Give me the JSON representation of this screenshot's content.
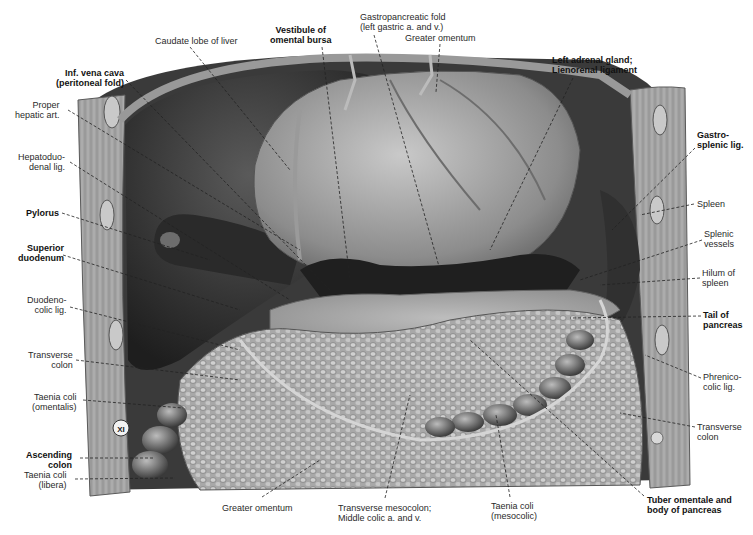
{
  "figure": {
    "vertebra_marker": "XI",
    "colors": {
      "background": "#ffffff",
      "label_text": "#2a2a2a",
      "leader_line": "#222222",
      "tissue_dark": "#2b2b2b",
      "tissue_mid": "#6e6e6e",
      "tissue_light": "#b9b9b9",
      "wall_muscle": "#9a9a9a"
    }
  },
  "labels": [
    {
      "id": "caudate-lobe",
      "text": "Caudate lobe of liver",
      "bold": false,
      "x": 155,
      "y": 36,
      "align": "left",
      "line": [
        [
          190,
          47
        ],
        [
          290,
          170
        ]
      ]
    },
    {
      "id": "inf-vena-cava",
      "text": "Inf. vena cava\n(peritoneal fold)",
      "bold": true,
      "x": 56,
      "y": 68,
      "align": "right",
      "line": [
        [
          126,
          80
        ],
        [
          330,
          290
        ]
      ]
    },
    {
      "id": "vestibule-omental-bursa",
      "text": "Vestibule of\nomental bursa",
      "bold": true,
      "x": 270,
      "y": 25,
      "align": "center",
      "line": [
        [
          322,
          47
        ],
        [
          350,
          280
        ]
      ]
    },
    {
      "id": "gastropancreatic-fold",
      "text": "Gastropancreatic fold\n(left gastric a. and v.)",
      "bold": false,
      "x": 360,
      "y": 12,
      "align": "left",
      "line": [
        [
          374,
          35
        ],
        [
          440,
          270
        ]
      ]
    },
    {
      "id": "greater-omentum-top",
      "text": "Greater omentum",
      "bold": false,
      "x": 405,
      "y": 33,
      "align": "left",
      "line": [
        [
          440,
          44
        ],
        [
          436,
          92
        ]
      ]
    },
    {
      "id": "left-adrenal",
      "text": "Left adrenal gland;\nLienorenal ligament",
      "bold": true,
      "x": 552,
      "y": 55,
      "align": "left",
      "line": [
        [
          573,
          78
        ],
        [
          490,
          250
        ]
      ]
    },
    {
      "id": "proper-hepatic-art",
      "text": "Proper\nhepatic art.",
      "bold": false,
      "x": 15,
      "y": 100,
      "align": "right",
      "line": [
        [
          68,
          110
        ],
        [
          300,
          250
        ]
      ]
    },
    {
      "id": "hepatoduodenal-lig",
      "text": "Hepatoduo-\ndenal lig.",
      "bold": false,
      "x": 18,
      "y": 152,
      "align": "right",
      "line": [
        [
          70,
          162
        ],
        [
          290,
          300
        ]
      ]
    },
    {
      "id": "gastrosplenic-lig",
      "text": "Gastro-\nsplenic lig.",
      "bold": true,
      "x": 697,
      "y": 130,
      "align": "left",
      "line": [
        [
          695,
          148
        ],
        [
          612,
          230
        ]
      ]
    },
    {
      "id": "pylorus",
      "text": "Pylorus",
      "bold": true,
      "x": 26,
      "y": 208,
      "align": "right",
      "line": [
        [
          62,
          213
        ],
        [
          210,
          260
        ]
      ]
    },
    {
      "id": "spleen",
      "text": "Spleen",
      "bold": false,
      "x": 697,
      "y": 199,
      "align": "left",
      "line": [
        [
          694,
          204
        ],
        [
          640,
          215
        ]
      ]
    },
    {
      "id": "splenic-vessels",
      "text": "Splenic\nvessels",
      "bold": false,
      "x": 704,
      "y": 229,
      "align": "left",
      "line": [
        [
          702,
          240
        ],
        [
          580,
          280
        ]
      ]
    },
    {
      "id": "superior-duodenum",
      "text": "Superior\nduodenum",
      "bold": true,
      "x": 18,
      "y": 243,
      "align": "right",
      "line": [
        [
          63,
          255
        ],
        [
          240,
          310
        ]
      ]
    },
    {
      "id": "hilum-of-spleen",
      "text": "Hilum of\nspleen",
      "bold": false,
      "x": 702,
      "y": 268,
      "align": "left",
      "line": [
        [
          700,
          278
        ],
        [
          600,
          285
        ]
      ]
    },
    {
      "id": "duodenocolic-lig",
      "text": "Duodeno-\ncolic lig.",
      "bold": false,
      "x": 27,
      "y": 295,
      "align": "right",
      "line": [
        [
          70,
          307
        ],
        [
          240,
          350
        ]
      ]
    },
    {
      "id": "tail-of-pancreas",
      "text": "Tail of\npancreas",
      "bold": true,
      "x": 703,
      "y": 310,
      "align": "left",
      "line": [
        [
          701,
          316
        ],
        [
          570,
          318
        ]
      ]
    },
    {
      "id": "transverse-colon-left",
      "text": "Transverse\ncolon",
      "bold": false,
      "x": 28,
      "y": 350,
      "align": "right",
      "line": [
        [
          76,
          360
        ],
        [
          240,
          380
        ]
      ]
    },
    {
      "id": "phrenicocolic-lig",
      "text": "Phrenico-\ncolic lig.",
      "bold": false,
      "x": 703,
      "y": 372,
      "align": "left",
      "line": [
        [
          701,
          378
        ],
        [
          645,
          355
        ]
      ]
    },
    {
      "id": "taenia-coli-omentalis",
      "text": "Taenia coli\n(omentalis)",
      "bold": false,
      "x": 32,
      "y": 392,
      "align": "right",
      "line": [
        [
          83,
          400
        ],
        [
          183,
          408
        ]
      ]
    },
    {
      "id": "transverse-colon-right",
      "text": "Transverse\ncolon",
      "bold": false,
      "x": 697,
      "y": 422,
      "align": "left",
      "line": [
        [
          695,
          427
        ],
        [
          620,
          413
        ]
      ]
    },
    {
      "id": "ascending-colon",
      "text": "Ascending\ncolon",
      "bold": true,
      "x": 26,
      "y": 450,
      "align": "right",
      "line": [
        [
          80,
          458
        ],
        [
          153,
          458
        ]
      ]
    },
    {
      "id": "taenia-coli-libera",
      "text": "Taenia coli\n(libera)",
      "bold": false,
      "x": 24,
      "y": 470,
      "align": "right",
      "line": [
        [
          75,
          479
        ],
        [
          175,
          478
        ]
      ]
    },
    {
      "id": "greater-omentum-bottom",
      "text": "Greater omentum",
      "bold": false,
      "x": 222,
      "y": 503,
      "align": "left",
      "line": [
        [
          262,
          497
        ],
        [
          320,
          460
        ]
      ]
    },
    {
      "id": "transverse-mesocolon",
      "text": "Transverse mesocolon;\nMiddle colic a. and v.",
      "bold": false,
      "x": 338,
      "y": 503,
      "align": "left",
      "line": [
        [
          385,
          498
        ],
        [
          410,
          395
        ]
      ]
    },
    {
      "id": "taenia-coli-mesocolic",
      "text": "Taenia coli\n(mesocolic)",
      "bold": false,
      "x": 491,
      "y": 501,
      "align": "left",
      "line": [
        [
          510,
          497
        ],
        [
          496,
          415
        ]
      ]
    },
    {
      "id": "tuber-omentale",
      "text": "Tuber omentale and\nbody of pancreas",
      "bold": true,
      "x": 647,
      "y": 495,
      "align": "left",
      "line": [
        [
          644,
          496
        ],
        [
          470,
          340
        ]
      ]
    }
  ]
}
